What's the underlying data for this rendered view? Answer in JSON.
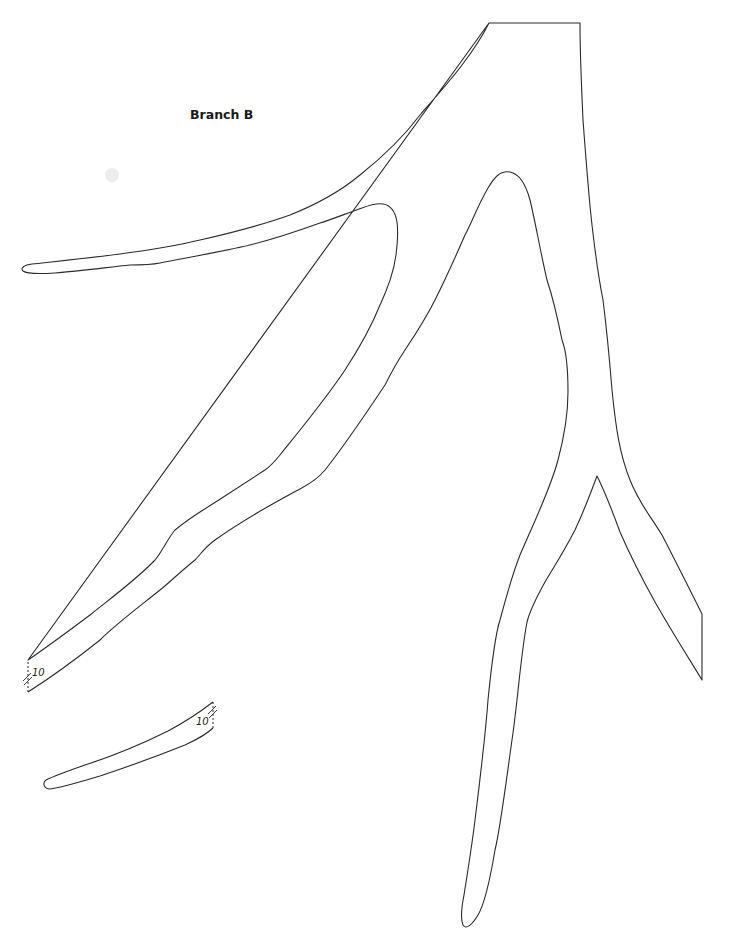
{
  "page": {
    "title": "Branch B",
    "background_color": "#ffffff",
    "line_color": "#2a2a2a"
  },
  "pattern_pieces": [
    {
      "name": "main-branch",
      "description": "Antler-shaped branch outline with trunk, upper-left tine, middle tine, and lower forked prongs",
      "seam_mark": {
        "label": "10",
        "position": "lower-left cut edge"
      }
    },
    {
      "name": "tine-extension",
      "description": "Small separate tapered piece that attaches at seam mark 10",
      "seam_mark": {
        "label": "10",
        "position": "upper-right cut edge"
      }
    }
  ],
  "labels": {
    "seam_main": "10",
    "seam_piece": "10"
  }
}
